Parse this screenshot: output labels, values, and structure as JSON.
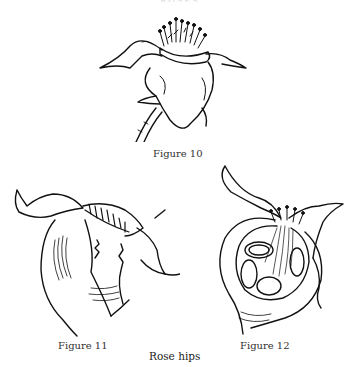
{
  "page": {
    "running_header": "ROSES",
    "figures": [
      {
        "id": "figure-10",
        "caption": "Figure 10"
      },
      {
        "id": "figure-11",
        "caption": "Figure 11"
      },
      {
        "id": "figure-12",
        "caption": "Figure 12"
      }
    ],
    "plate_title": "Rose hips"
  },
  "colors": {
    "ink": "#111111",
    "paper": "#ffffff"
  }
}
